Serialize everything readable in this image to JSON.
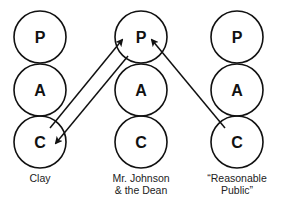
{
  "diagram": {
    "type": "transactional-analysis-ego-states",
    "columns": [
      {
        "id": "clay",
        "label_lines": [
          "Clay"
        ],
        "states": [
          "P",
          "A",
          "C"
        ]
      },
      {
        "id": "johnson-dean",
        "label_lines": [
          "Mr. Johnson",
          "& the Dean"
        ],
        "states": [
          "P",
          "A",
          "C"
        ]
      },
      {
        "id": "reasonable-public",
        "label_lines": [
          "“Reasonable",
          "Public”"
        ],
        "states": [
          "P",
          "A",
          "C"
        ]
      }
    ],
    "arrows": [
      {
        "from": "clay.C",
        "to": "johnson-dean.P"
      },
      {
        "from": "johnson-dean.P",
        "to": "clay.C"
      },
      {
        "from": "reasonable-public.C",
        "to": "johnson-dean.P"
      }
    ],
    "colors": {
      "stroke": "#111111",
      "text": "#222222",
      "background": "#ffffff"
    }
  }
}
